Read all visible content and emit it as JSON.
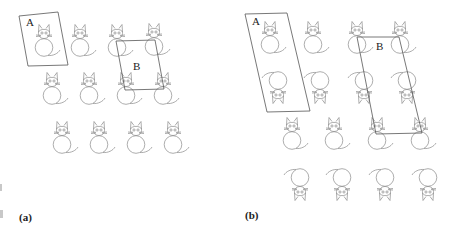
{
  "figure": {
    "panels": [
      {
        "id": "a",
        "label": "(a)",
        "unit_cell_A": {
          "label": "A",
          "points": "19,16 58,12 68,65 28,66",
          "label_pos": [
            26,
            26
          ]
        },
        "unit_cell_B": {
          "label": "B",
          "points": "116,41 155,40 164,89 125,90",
          "label_pos": [
            133,
            70
          ]
        },
        "cats": [
          {
            "x": 44,
            "y": 33,
            "inverted": false
          },
          {
            "x": 80,
            "y": 33,
            "inverted": false
          },
          {
            "x": 117,
            "y": 33,
            "inverted": false
          },
          {
            "x": 154,
            "y": 32,
            "inverted": false
          },
          {
            "x": 52,
            "y": 81,
            "inverted": false
          },
          {
            "x": 89,
            "y": 81,
            "inverted": false
          },
          {
            "x": 126,
            "y": 81,
            "inverted": false
          },
          {
            "x": 163,
            "y": 81,
            "inverted": false
          },
          {
            "x": 62,
            "y": 130,
            "inverted": false
          },
          {
            "x": 99,
            "y": 130,
            "inverted": false
          },
          {
            "x": 136,
            "y": 130,
            "inverted": false
          },
          {
            "x": 173,
            "y": 130,
            "inverted": false
          }
        ]
      },
      {
        "id": "b",
        "label": "(b)",
        "unit_cell_A": {
          "label": "A",
          "points": "245,14 287,13 310,111 267,112",
          "label_pos": [
            252,
            25
          ]
        },
        "unit_cell_B": {
          "label": "B",
          "points": "357,37 399,37 422,133 376,134",
          "label_pos": [
            376,
            50
          ]
        },
        "cats": [
          {
            "x": 270,
            "y": 30,
            "inverted": false
          },
          {
            "x": 313,
            "y": 30,
            "inverted": false
          },
          {
            "x": 357,
            "y": 30,
            "inverted": false
          },
          {
            "x": 400,
            "y": 30,
            "inverted": false
          },
          {
            "x": 278,
            "y": 95,
            "inverted": true
          },
          {
            "x": 320,
            "y": 95,
            "inverted": true
          },
          {
            "x": 364,
            "y": 95,
            "inverted": true
          },
          {
            "x": 407,
            "y": 95,
            "inverted": true
          },
          {
            "x": 292,
            "y": 126,
            "inverted": false
          },
          {
            "x": 334,
            "y": 126,
            "inverted": false
          },
          {
            "x": 377,
            "y": 126,
            "inverted": false
          },
          {
            "x": 420,
            "y": 126,
            "inverted": false
          },
          {
            "x": 300,
            "y": 192,
            "inverted": true
          },
          {
            "x": 342,
            "y": 192,
            "inverted": true
          },
          {
            "x": 385,
            "y": 192,
            "inverted": true
          },
          {
            "x": 428,
            "y": 192,
            "inverted": true
          }
        ]
      }
    ]
  },
  "labels": {
    "a_cell_A": "A",
    "a_cell_B": "B",
    "a_panel": "(a)",
    "b_cell_A": "A",
    "b_cell_B": "B",
    "b_panel": "(b)"
  }
}
